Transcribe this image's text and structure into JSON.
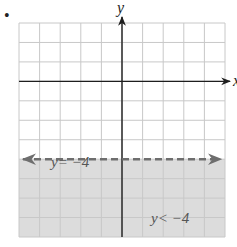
{
  "figure": {
    "bullet": "•",
    "colors": {
      "grid": "#c8c8c8",
      "axis": "#1e1e1e",
      "shade": "#dcdcdc",
      "boundary": "#6e6e6e",
      "label": "#555555"
    }
  },
  "chart_data": {
    "type": "inequality-graph",
    "title": "",
    "xlabel": "x",
    "ylabel": "y",
    "grid": true,
    "xlim": [
      -5,
      5
    ],
    "ylim": [
      -8,
      3
    ],
    "gridlines_x": [
      -5,
      -4,
      -3,
      -2,
      -1,
      0,
      1,
      2,
      3,
      4,
      5
    ],
    "gridlines_y": [
      -8,
      -7,
      -6,
      -5,
      -4,
      -3,
      -2,
      -1,
      0,
      1,
      2,
      3
    ],
    "boundary": {
      "equation": "y = -4",
      "label": "y= −4",
      "value": -4,
      "style": "dashed",
      "arrows": "both"
    },
    "inequality": {
      "label": "y< −4",
      "relation": "<",
      "value": -4,
      "shaded_region": "below"
    },
    "annotations": [
      {
        "text": "y= −4",
        "x": -3.4,
        "y": -3.5
      },
      {
        "text": "y< −4",
        "x": 2.1,
        "y": -7.2
      }
    ]
  }
}
